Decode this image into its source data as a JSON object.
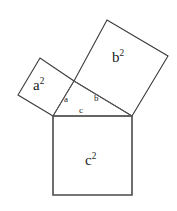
{
  "figure": {
    "background_color": "#ffffff",
    "stroke_color": "#3a3a3a",
    "text_color": "#1c1c1c",
    "width": 177,
    "height": 211
  },
  "labels": {
    "square_a": {
      "base": "a",
      "exponent": "2",
      "text": "a²"
    },
    "square_b": {
      "base": "b",
      "exponent": "2",
      "text": "b²"
    },
    "square_c": {
      "base": "c",
      "exponent": "2",
      "text": "c²"
    },
    "side_a": "a",
    "side_b": "b",
    "side_c": "c"
  },
  "geometry": {
    "triangle": {
      "name": "right-triangle",
      "vertex_right_angle": [
        74,
        81
      ],
      "vertex_left": [
        53,
        116
      ],
      "vertex_right": [
        132,
        116
      ],
      "points": "53,116 74,81 132,116"
    },
    "square_a": {
      "name": "square-on-leg-a",
      "points": "53,116 74,81 40,58 18,95"
    },
    "square_b": {
      "name": "square-on-leg-b",
      "points": "74,81 132,116 168,56 107,20"
    },
    "square_c": {
      "name": "square-on-hypotenuse-c",
      "points": "53,116 132,116 132,195 53,195"
    }
  }
}
